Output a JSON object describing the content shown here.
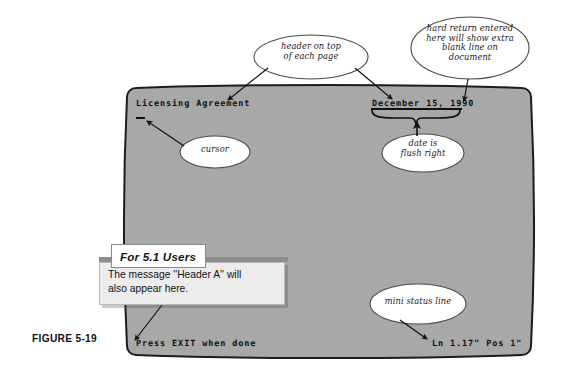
{
  "figure": {
    "caption": "FIGURE 5-19"
  },
  "screen": {
    "bg_color": "#a8a8a8",
    "border_color": "#1c1c1c",
    "header_text": "Licensing Agreement",
    "date_text": "December 15, 1990",
    "status_left": "Press EXIT when done",
    "status_right": "Ln 1.17\" Pos 1\"",
    "cursor_glyph": "_"
  },
  "annotations": [
    {
      "name": "header-on-top",
      "text": "header on top\nof each page"
    },
    {
      "name": "hard-return",
      "text": "hard return entered\nhere will show extra\nblank line on\ndocument"
    },
    {
      "name": "cursor",
      "text": "cursor"
    },
    {
      "name": "date-flush-right",
      "text": "date is\nflush right"
    },
    {
      "name": "mini-status-line",
      "text": "mini status line"
    }
  ],
  "callout": {
    "title": "For 5.1 Users",
    "body": "The message ''Header A'' will\n   also appear here.",
    "bar_color": "#8d8d8d",
    "body_color": "#ececec",
    "title_bg": "#ffffff"
  }
}
